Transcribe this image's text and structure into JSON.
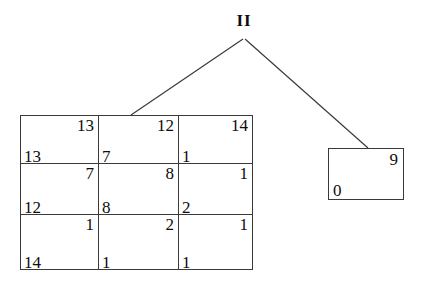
{
  "diagram": {
    "type": "tree-diagram",
    "root": {
      "label": "II"
    },
    "edges": [
      {
        "name": "edge-root-to-matrix",
        "from": "root",
        "to": "matrix-node"
      },
      {
        "name": "edge-root-to-leaf",
        "from": "root",
        "to": "leaf-node"
      }
    ],
    "matrix_node": {
      "rows": 3,
      "cols": 3,
      "cells": [
        [
          {
            "top_right": "13",
            "bottom_left": "13"
          },
          {
            "top_right": "12",
            "bottom_left": "7"
          },
          {
            "top_right": "14",
            "bottom_left": "1"
          }
        ],
        [
          {
            "top_right": "7",
            "bottom_left": "12"
          },
          {
            "top_right": "8",
            "bottom_left": "8"
          },
          {
            "top_right": "1",
            "bottom_left": "2"
          }
        ],
        [
          {
            "top_right": "1",
            "bottom_left": "14"
          },
          {
            "top_right": "2",
            "bottom_left": "1"
          },
          {
            "top_right": "1",
            "bottom_left": "1"
          }
        ]
      ]
    },
    "leaf_node": {
      "top_right": "9",
      "bottom_left": "0"
    },
    "colors": {
      "background": "#ffffff",
      "stroke": "#3a3a3a",
      "text": "#0d0d0d"
    }
  }
}
